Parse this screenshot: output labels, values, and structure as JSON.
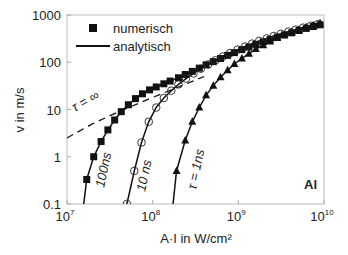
{
  "chart_data": {
    "type": "line",
    "title": "",
    "xlabel": "A·I  in W/cm²",
    "ylabel": "v in m/s",
    "xscale": "log",
    "yscale": "log",
    "xlim": [
      10000000.0,
      10000000000.0
    ],
    "ylim": [
      0.1,
      1000
    ],
    "x_ticks": [
      {
        "value": 10000000.0,
        "base": "10",
        "exp": "7"
      },
      {
        "value": 100000000.0,
        "base": "10",
        "exp": "8"
      },
      {
        "value": 1000000000.0,
        "base": "10",
        "exp": "9"
      },
      {
        "value": 10000000000.0,
        "base": "10",
        "exp": "10"
      }
    ],
    "y_ticks": [
      {
        "value": 0.1,
        "label": "0.1"
      },
      {
        "value": 1,
        "label": "1"
      },
      {
        "value": 10,
        "label": "10"
      },
      {
        "value": 100,
        "label": "100"
      },
      {
        "value": 1000,
        "label": "1000"
      }
    ],
    "grid": false,
    "legend": {
      "position": "upper-left",
      "entries": [
        {
          "label": "numerisch",
          "marker": "square"
        },
        {
          "label": "analytisch",
          "marker": "line"
        }
      ]
    },
    "annotations": [
      {
        "text": "τ = ∞",
        "x": 12500000.0,
        "y": 12,
        "rotation": -28
      },
      {
        "text": "100ns",
        "x": 24000000.0,
        "y": 0.25,
        "rotation": -80
      },
      {
        "text": "10 ns",
        "x": 72000000.0,
        "y": 0.22,
        "rotation": -80
      },
      {
        "text": "τ = 1ns",
        "x": 220000000.0,
        "y": 0.2,
        "rotation": -80
      },
      {
        "text": "Al",
        "x": 7000000000.0,
        "y": 0.2,
        "bold": true
      }
    ],
    "series": [
      {
        "name": "τ = ∞ (analytisch)",
        "style": "dashed",
        "x": [
          10000000.0,
          20000000.0,
          40000000.0,
          100000000.0,
          200000000.0,
          400000000.0
        ],
        "y": [
          2.5,
          5,
          9,
          18,
          30,
          50
        ]
      },
      {
        "name": "100ns numerisch",
        "marker": "square",
        "x": [
          17000000.0,
          20500000.0,
          25000000.0,
          30000000.0,
          36000000.0,
          43000000.0,
          52000000.0,
          63000000.0,
          76000000.0,
          92000000.0,
          110000000.0,
          135000000.0,
          160000000.0,
          200000000.0,
          240000000.0,
          290000000.0,
          350000000.0,
          420000000.0,
          510000000.0,
          620000000.0,
          750000000.0,
          900000000.0,
          1100000000.0,
          1330000000.0,
          1600000000.0,
          1950000000.0,
          2350000000.0,
          2850000000.0,
          3450000000.0,
          4200000000.0,
          5100000000.0,
          6200000000.0,
          7500000000.0,
          9000000000.0
        ],
        "y": [
          0.33,
          1.0,
          2.1,
          3.7,
          6.0,
          9.0,
          12.6,
          17,
          21.5,
          26,
          30,
          35,
          40,
          47,
          55,
          64,
          75,
          88,
          103,
          120,
          140,
          160,
          185,
          210,
          240,
          270,
          305,
          340,
          380,
          420,
          470,
          520,
          570,
          620
        ]
      },
      {
        "name": "10 ns numerisch",
        "marker": "circle-open",
        "x": [
          50000000.0,
          61000000.0,
          74000000.0,
          90000000.0,
          110000000.0,
          135000000.0,
          165000000.0,
          200000000.0,
          245000000.0,
          300000000.0,
          365000000.0,
          445000000.0,
          540000000.0,
          660000000.0,
          800000000.0,
          980000000.0,
          1200000000.0,
          1450000000.0,
          1750000000.0,
          2150000000.0,
          2600000000.0,
          3150000000.0,
          3850000000.0,
          4700000000.0,
          5700000000.0,
          7000000000.0,
          8500000000.0
        ],
        "y": [
          0.1,
          0.5,
          2.0,
          5.5,
          11,
          17.5,
          25,
          34,
          45,
          58,
          73,
          90,
          110,
          132,
          157,
          185,
          215,
          248,
          283,
          320,
          360,
          400,
          445,
          490,
          540,
          590,
          640
        ]
      },
      {
        "name": "τ = 1ns numerisch",
        "marker": "triangle",
        "x": [
          190000000.0,
          240000000.0,
          290000000.0,
          350000000.0,
          420000000.0,
          510000000.0,
          620000000.0,
          750000000.0,
          900000000.0,
          1100000000.0,
          1330000000.0,
          1600000000.0,
          1950000000.0,
          2350000000.0,
          2850000000.0,
          3450000000.0,
          4200000000.0,
          5100000000.0,
          6200000000.0,
          7500000000.0,
          9000000000.0
        ],
        "y": [
          0.5,
          2.2,
          5.5,
          11,
          20,
          32,
          48,
          68,
          92,
          120,
          152,
          190,
          230,
          275,
          325,
          375,
          430,
          490,
          550,
          610,
          670
        ]
      }
    ]
  }
}
